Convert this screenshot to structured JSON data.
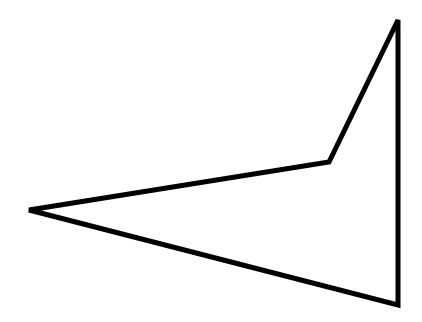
{
  "diagram": {
    "type": "polygon",
    "shape": "quadrilateral",
    "stroke_color": "#000000",
    "fill_color": "#ffffff",
    "stroke_width": 5,
    "vertices": [
      {
        "x": 29,
        "y": 210
      },
      {
        "x": 329,
        "y": 162
      },
      {
        "x": 398,
        "y": 20
      },
      {
        "x": 398,
        "y": 305
      }
    ]
  }
}
